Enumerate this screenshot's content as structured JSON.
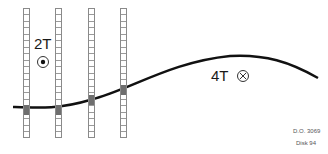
{
  "diagram": {
    "labels": {
      "left_field": "2T",
      "right_field": "4T",
      "ref_code": "D.O. 3069",
      "disk": "Disk 94"
    },
    "symbols": {
      "left_field_symbol": "dot-in-circle (out of page)",
      "right_field_symbol": "cross-in-circle (into page)"
    },
    "columns": [
      {
        "x": 23,
        "filled_top": 104,
        "filled_height": 10
      },
      {
        "x": 55,
        "filled_top": 104,
        "filled_height": 10
      },
      {
        "x": 88,
        "filled_top": 94,
        "filled_height": 10
      },
      {
        "x": 120,
        "filled_top": 84,
        "filled_height": 10
      }
    ],
    "colors": {
      "curve": "#111111",
      "column_border": "#8a8a8a",
      "filled_cell": "#6e6e6e"
    }
  }
}
